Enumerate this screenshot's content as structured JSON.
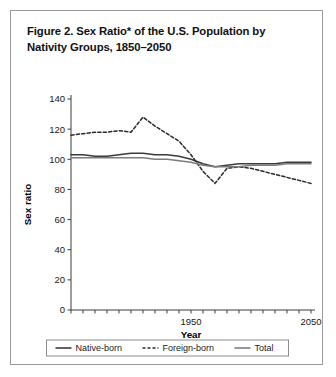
{
  "figure": {
    "title": "Figure 2. Sex Ratio* of the U.S. Population by Nativity Groups, 1850–2050"
  },
  "chart_data": {
    "type": "line",
    "title": "Figure 2. Sex Ratio* of the U.S. Population by Nativity Groups, 1850–2050",
    "xlabel": "Year",
    "ylabel": "Sex ratio",
    "xlim": [
      1850,
      2050
    ],
    "ylim": [
      0,
      140
    ],
    "ytick_values": [
      0,
      20,
      40,
      60,
      80,
      100,
      120,
      140
    ],
    "ytick_labels": [
      "0",
      "20",
      "40",
      "60",
      "80",
      "100",
      "120",
      "140"
    ],
    "xtick_values": [
      1850,
      1860,
      1870,
      1880,
      1890,
      1900,
      1910,
      1920,
      1930,
      1940,
      1950,
      1960,
      1970,
      1980,
      1990,
      2000,
      2010,
      2020,
      2030,
      2040,
      2050
    ],
    "xtick_labels_shown": [
      "1950",
      "2050"
    ],
    "xtick_labeled_values": [
      1950,
      2050
    ],
    "grid": false,
    "legend_position": "bottom",
    "x": [
      1850,
      1860,
      1870,
      1880,
      1890,
      1900,
      1910,
      1920,
      1930,
      1940,
      1950,
      1960,
      1970,
      1980,
      1990,
      2000,
      2010,
      2020,
      2030,
      2040,
      2050
    ],
    "series": [
      {
        "name": "Native-born",
        "style": "solid",
        "color": "#3b3b3b",
        "values": [
          103,
          103,
          102,
          102,
          103,
          104,
          104,
          103,
          103,
          102,
          100,
          97,
          95,
          96,
          97,
          97,
          97,
          97,
          98,
          98,
          98
        ]
      },
      {
        "name": "Foreign-born",
        "style": "dashed",
        "color": "#2b2b2b",
        "values": [
          116,
          117,
          118,
          118,
          119,
          118,
          128,
          122,
          117,
          112,
          103,
          92,
          84,
          94,
          95,
          94,
          92,
          90,
          88,
          86,
          84
        ]
      },
      {
        "name": "Total",
        "style": "solid",
        "color": "#7d7d7d",
        "values": [
          101,
          101,
          101,
          101,
          101,
          101,
          101,
          100,
          100,
          99,
          98,
          96,
          95,
          95,
          95,
          96,
          96,
          96,
          97,
          97,
          97
        ]
      }
    ]
  },
  "legend": {
    "items": [
      {
        "label": "Native-born",
        "style": "solid",
        "color": "#3b3b3b"
      },
      {
        "label": "Foreign-born",
        "style": "dashed",
        "color": "#2b2b2b"
      },
      {
        "label": "Total",
        "style": "solid",
        "color": "#7d7d7d"
      }
    ]
  },
  "axes": {
    "x_title": "Year",
    "y_title": "Sex ratio"
  }
}
